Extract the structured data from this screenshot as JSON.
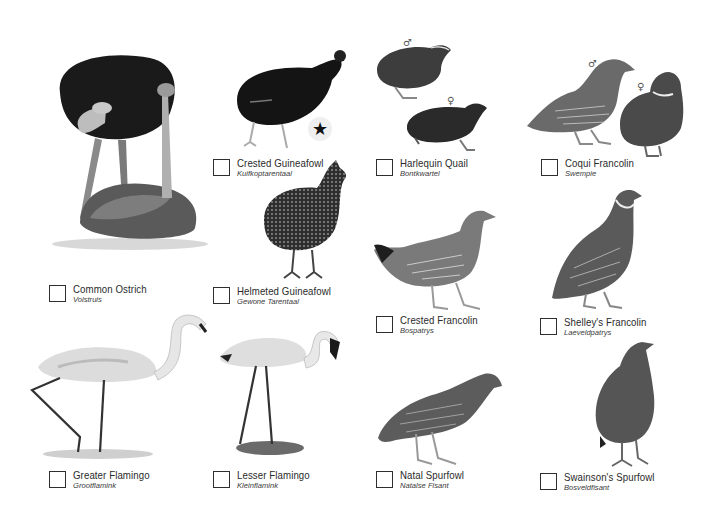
{
  "checklist": {
    "entries": [
      {
        "english": "Common Ostrich",
        "afrikaans": "Volstruis"
      },
      {
        "english": "Crested Guineafowl",
        "afrikaans": "Kuifkoptarentaal"
      },
      {
        "english": "Harlequin Quail",
        "afrikaans": "Bontkwartel"
      },
      {
        "english": "Coqui Francolin",
        "afrikaans": "Swempie"
      },
      {
        "english": "Helmeted Guineafowl",
        "afrikaans": "Gewone Tarentaal"
      },
      {
        "english": "Crested Francolin",
        "afrikaans": "Bospatrys"
      },
      {
        "english": "Shelley's Francolin",
        "afrikaans": "Laeveldpatrys"
      },
      {
        "english": "Greater Flamingo",
        "afrikaans": "Grootflamink"
      },
      {
        "english": "Lesser Flamingo",
        "afrikaans": "Kleinflamink"
      },
      {
        "english": "Natal Spurfowl",
        "afrikaans": "Natalse Fisant"
      },
      {
        "english": "Swainson's Spurfowl",
        "afrikaans": "Bosveldfisant"
      }
    ]
  },
  "markers": {
    "male": "♂",
    "female": "♀",
    "star": "★"
  },
  "icons": {
    "checkbox": "checkbox-icon",
    "star": "star-icon",
    "male": "male-symbol-icon",
    "female": "female-symbol-icon"
  }
}
